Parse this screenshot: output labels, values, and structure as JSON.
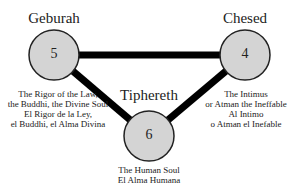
{
  "nodes": [
    {
      "name": "Geburah",
      "number": "5",
      "desc": [
        "The Rigor of the Law,",
        "the Buddhi, the Divine Soul",
        "El Rigor de la Ley,",
        "el Buddhi, el Alma Divina"
      ]
    },
    {
      "name": "Chesed",
      "number": "4",
      "desc": [
        "The Intimus",
        "or Atman the Ineffable",
        "Al Intimo",
        "o Atman el Inefable"
      ]
    },
    {
      "name": "Tiphereth",
      "number": "6",
      "desc": [
        "The Human Soul",
        "El Alma Humana"
      ]
    }
  ],
  "colors": {
    "circle_fill": "#d4d4d4",
    "line": "#000000"
  }
}
